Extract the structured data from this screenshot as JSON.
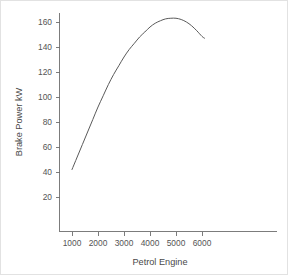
{
  "chart_data": {
    "type": "line",
    "title": "",
    "xlabel": "Petrol Engine",
    "ylabel": "Brake Power kW",
    "xlim": [
      500,
      6600
    ],
    "ylim": [
      0,
      172
    ],
    "grid": false,
    "legend": false,
    "legend_position": "none",
    "xticks": [
      1000,
      2000,
      3000,
      4000,
      5000,
      6000
    ],
    "xtick_labels": [
      "1000",
      "2000",
      "3000",
      "4000",
      "5000",
      "6000"
    ],
    "yticks": [
      20,
      40,
      60,
      80,
      100,
      120,
      140,
      160
    ],
    "ytick_labels": [
      "20",
      "40",
      "60",
      "80",
      "100",
      "120",
      "140",
      "160"
    ],
    "series": [
      {
        "name": "Brake Power",
        "color": "#5a5a5a",
        "x": [
          1000,
          1200,
          1400,
          1600,
          1800,
          2000,
          2200,
          2400,
          2600,
          2800,
          3000,
          3200,
          3400,
          3600,
          3800,
          4000,
          4200,
          4400,
          4600,
          4800,
          5000,
          5200,
          5400,
          5600,
          5800,
          6000,
          6100
        ],
        "values": [
          42,
          52,
          62,
          72,
          82,
          92,
          101,
          110,
          118,
          125,
          132,
          138,
          143,
          148,
          152,
          156,
          159,
          161,
          162.5,
          163,
          163,
          162,
          160,
          157,
          153,
          148.5,
          147
        ]
      }
    ],
    "annotations": []
  },
  "axes": {
    "x_axis_name": "x-axis",
    "y_axis_name": "y-axis"
  }
}
